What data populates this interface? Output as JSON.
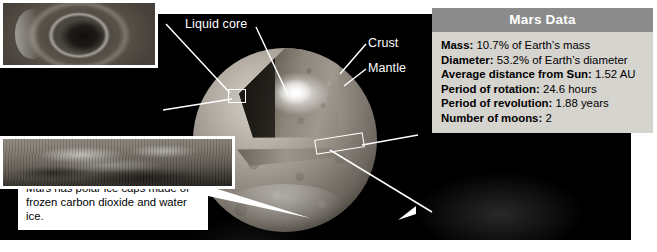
{
  "diagram": {
    "title_visible": false,
    "globe_labels": [
      {
        "name": "liquid-core",
        "text": "Liquid core"
      },
      {
        "name": "crust",
        "text": "Crust"
      },
      {
        "name": "mantle",
        "text": "Mantle"
      }
    ]
  },
  "mars_data": {
    "header": "Mars Data",
    "rows": [
      {
        "label": "Mass:",
        "value": " 10.7% of Earth’s mass"
      },
      {
        "label": "Diameter:",
        "value": " 53.2% of Earth’s diameter"
      },
      {
        "label": "Average distance from Sun:",
        "value": " 1.52 AU"
      },
      {
        "label": "Period of rotation:",
        "value": " 24.6 hours"
      },
      {
        "label": "Period of revolution:",
        "value": " 1.88 years"
      },
      {
        "label": "Number of moons:",
        "value": " 2"
      }
    ]
  },
  "callouts": {
    "olympus": {
      "image_alt": "olympus-mons-volcano-photo",
      "term": "Olympus Mons",
      "text": " is a volcano that is as wide as Arizona and three times as high as Mount Everest."
    },
    "ice_caps": {
      "text": "Mars has polar ice caps made of frozen carbon dioxide and water ice."
    },
    "valles": {
      "image_alt": "valles-marineris-canyon-photo",
      "term": "Valles Marineris",
      "text": " is a canyon that is as long as the United States."
    }
  },
  "colors": {
    "panel_background": "#000000",
    "page_background": "#ffffff",
    "table_header": "#8b8b8b",
    "table_body": "#d6d4cf",
    "label_text": "#ffffff",
    "leader_line": "#ffffff"
  }
}
